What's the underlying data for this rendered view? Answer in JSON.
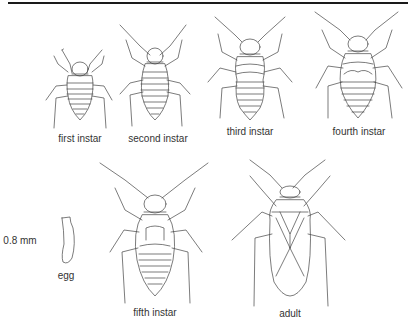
{
  "figure": {
    "stages": [
      {
        "id": "first",
        "label": "first instar"
      },
      {
        "id": "second",
        "label": "second instar"
      },
      {
        "id": "third",
        "label": "third instar"
      },
      {
        "id": "fourth",
        "label": "fourth instar"
      },
      {
        "id": "fifth",
        "label": "fifth instar"
      },
      {
        "id": "adult",
        "label": "adult"
      }
    ],
    "egg": {
      "label": "egg",
      "scale": "0.8 mm"
    }
  }
}
